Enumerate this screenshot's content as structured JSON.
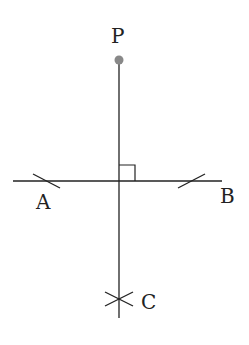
{
  "diagram": {
    "labels": {
      "P": "P",
      "A": "A",
      "B": "B",
      "C": "C"
    },
    "colors": {
      "line": "#222222",
      "point": "#888888"
    }
  }
}
